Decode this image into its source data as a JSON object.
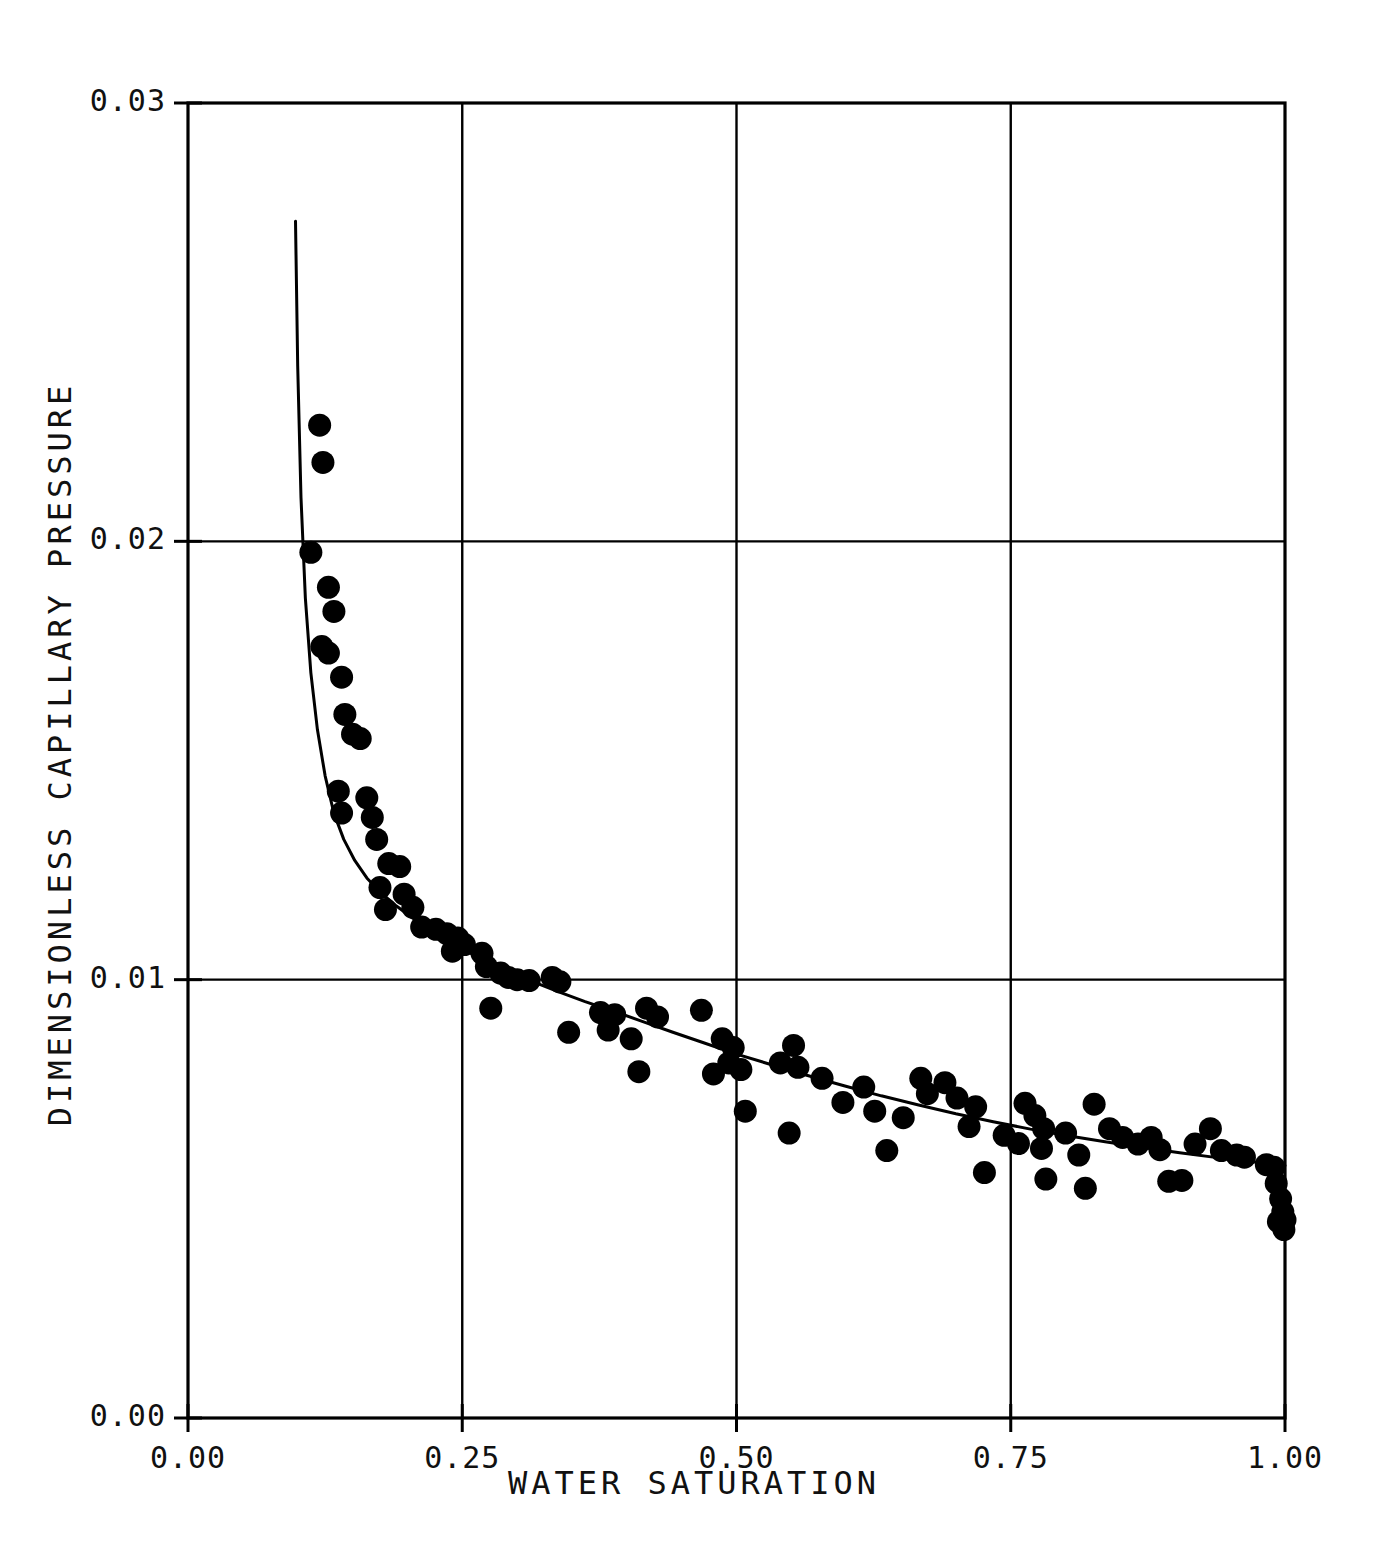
{
  "chart_data": {
    "type": "scatter",
    "title": "",
    "xlabel": "WATER SATURATION",
    "ylabel": "DIMENSIONLESS CAPILLARY PRESSURE",
    "xlim": [
      0.0,
      1.0
    ],
    "ylim": [
      0.0,
      0.03
    ],
    "grid": true,
    "legend": null,
    "xticks": [
      0.0,
      0.25,
      0.5,
      0.75,
      1.0
    ],
    "xticklabels": [
      "0.00",
      "0.25",
      "0.50",
      "0.75",
      "1.00"
    ],
    "yticks": [
      0.0,
      0.01,
      0.02,
      0.03
    ],
    "yticklabels": [
      "0.00",
      "0.01",
      "0.02",
      "0.03"
    ],
    "gridlines_x": [
      0.25,
      0.5,
      0.75
    ],
    "gridlines_y": [
      0.01,
      0.02
    ],
    "marker": {
      "shape": "circle",
      "filled": true,
      "color": "#000000",
      "size_px": 23
    },
    "series": [
      {
        "name": "measured data",
        "type": "scatter",
        "points": [
          [
            0.12,
            0.02265
          ],
          [
            0.123,
            0.0218
          ],
          [
            0.112,
            0.01975
          ],
          [
            0.128,
            0.01895
          ],
          [
            0.133,
            0.0184
          ],
          [
            0.122,
            0.0176
          ],
          [
            0.128,
            0.01745
          ],
          [
            0.14,
            0.0169
          ],
          [
            0.143,
            0.01605
          ],
          [
            0.15,
            0.0156
          ],
          [
            0.157,
            0.0155
          ],
          [
            0.137,
            0.0143
          ],
          [
            0.14,
            0.0138
          ],
          [
            0.163,
            0.01415
          ],
          [
            0.168,
            0.0137
          ],
          [
            0.172,
            0.0132
          ],
          [
            0.183,
            0.01265
          ],
          [
            0.193,
            0.01258
          ],
          [
            0.175,
            0.0121
          ],
          [
            0.18,
            0.0116
          ],
          [
            0.197,
            0.01195
          ],
          [
            0.205,
            0.01165
          ],
          [
            0.213,
            0.0112
          ],
          [
            0.226,
            0.01115
          ],
          [
            0.236,
            0.01105
          ],
          [
            0.246,
            0.01095
          ],
          [
            0.252,
            0.0108
          ],
          [
            0.241,
            0.01065
          ],
          [
            0.268,
            0.0106
          ],
          [
            0.272,
            0.0103
          ],
          [
            0.285,
            0.01015
          ],
          [
            0.292,
            0.01005
          ],
          [
            0.3,
            0.01
          ],
          [
            0.311,
            0.00998
          ],
          [
            0.332,
            0.01005
          ],
          [
            0.339,
            0.00995
          ],
          [
            0.276,
            0.00935
          ],
          [
            0.347,
            0.0088
          ],
          [
            0.376,
            0.00925
          ],
          [
            0.389,
            0.0092
          ],
          [
            0.383,
            0.00885
          ],
          [
            0.404,
            0.00865
          ],
          [
            0.418,
            0.00935
          ],
          [
            0.428,
            0.00915
          ],
          [
            0.411,
            0.0079
          ],
          [
            0.468,
            0.0093
          ],
          [
            0.487,
            0.00865
          ],
          [
            0.497,
            0.00845
          ],
          [
            0.493,
            0.0081
          ],
          [
            0.504,
            0.00795
          ],
          [
            0.479,
            0.00785
          ],
          [
            0.508,
            0.007
          ],
          [
            0.54,
            0.0081
          ],
          [
            0.552,
            0.0085
          ],
          [
            0.556,
            0.008
          ],
          [
            0.548,
            0.0065
          ],
          [
            0.578,
            0.00775
          ],
          [
            0.597,
            0.0072
          ],
          [
            0.616,
            0.00755
          ],
          [
            0.626,
            0.007
          ],
          [
            0.637,
            0.0061
          ],
          [
            0.652,
            0.00685
          ],
          [
            0.668,
            0.00775
          ],
          [
            0.674,
            0.0074
          ],
          [
            0.69,
            0.00765
          ],
          [
            0.701,
            0.0073
          ],
          [
            0.712,
            0.00665
          ],
          [
            0.718,
            0.0071
          ],
          [
            0.726,
            0.0056
          ],
          [
            0.744,
            0.00645
          ],
          [
            0.757,
            0.00626
          ],
          [
            0.763,
            0.00718
          ],
          [
            0.772,
            0.0069
          ],
          [
            0.78,
            0.0066
          ],
          [
            0.778,
            0.00615
          ],
          [
            0.782,
            0.00545
          ],
          [
            0.8,
            0.0065
          ],
          [
            0.812,
            0.006
          ],
          [
            0.818,
            0.00524
          ],
          [
            0.826,
            0.00716
          ],
          [
            0.84,
            0.0066
          ],
          [
            0.852,
            0.0064
          ],
          [
            0.866,
            0.00625
          ],
          [
            0.878,
            0.0064
          ],
          [
            0.886,
            0.00612
          ],
          [
            0.894,
            0.0054
          ],
          [
            0.906,
            0.00542
          ],
          [
            0.918,
            0.00625
          ],
          [
            0.932,
            0.0066
          ],
          [
            0.942,
            0.0061
          ],
          [
            0.956,
            0.006
          ],
          [
            0.963,
            0.00595
          ],
          [
            0.983,
            0.00578
          ],
          [
            0.99,
            0.00572
          ],
          [
            0.992,
            0.00535
          ],
          [
            0.996,
            0.005
          ],
          [
            0.998,
            0.0047
          ],
          [
            0.994,
            0.00448
          ],
          [
            1.0,
            0.00452
          ],
          [
            0.999,
            0.0043
          ]
        ]
      },
      {
        "name": "fitted curve",
        "type": "line",
        "points": [
          [
            0.098,
            0.0273
          ],
          [
            0.1,
            0.024
          ],
          [
            0.103,
            0.021
          ],
          [
            0.107,
            0.0187
          ],
          [
            0.112,
            0.017
          ],
          [
            0.118,
            0.0157
          ],
          [
            0.125,
            0.01465
          ],
          [
            0.133,
            0.0138
          ],
          [
            0.142,
            0.0132
          ],
          [
            0.152,
            0.01272
          ],
          [
            0.163,
            0.01232
          ],
          [
            0.175,
            0.012
          ],
          [
            0.19,
            0.01168
          ],
          [
            0.205,
            0.0114
          ],
          [
            0.222,
            0.01112
          ],
          [
            0.24,
            0.01086
          ],
          [
            0.258,
            0.0106
          ],
          [
            0.277,
            0.01037
          ],
          [
            0.296,
            0.01015
          ],
          [
            0.316,
            0.00994
          ],
          [
            0.338,
            0.00972
          ],
          [
            0.362,
            0.0095
          ],
          [
            0.388,
            0.00928
          ],
          [
            0.414,
            0.00905
          ],
          [
            0.442,
            0.0088
          ],
          [
            0.47,
            0.00856
          ],
          [
            0.5,
            0.0083
          ],
          [
            0.532,
            0.00806
          ],
          [
            0.564,
            0.00782
          ],
          [
            0.598,
            0.00758
          ],
          [
            0.632,
            0.00735
          ],
          [
            0.666,
            0.00714
          ],
          [
            0.7,
            0.00694
          ],
          [
            0.734,
            0.00676
          ],
          [
            0.768,
            0.00659
          ],
          [
            0.802,
            0.00644
          ],
          [
            0.836,
            0.0063
          ],
          [
            0.87,
            0.00617
          ],
          [
            0.904,
            0.00605
          ],
          [
            0.938,
            0.00594
          ],
          [
            0.968,
            0.00585
          ],
          [
            1.0,
            0.00576
          ]
        ]
      }
    ]
  },
  "axes": {
    "x_title": "WATER SATURATION",
    "y_title": "DIMENSIONLESS CAPILLARY PRESSURE",
    "x_tick_labels": [
      "0.00",
      "0.25",
      "0.50",
      "0.75",
      "1.00"
    ],
    "y_tick_labels": [
      "0.00",
      "0.01",
      "0.02",
      "0.03"
    ],
    "frame_color": "#000000",
    "background_color": "#ffffff"
  }
}
